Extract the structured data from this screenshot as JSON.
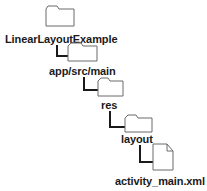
{
  "tree": {
    "nodes": [
      {
        "type": "folder",
        "label": "LinearLayoutExample"
      },
      {
        "type": "folder",
        "label": "app/src/main"
      },
      {
        "type": "folder",
        "label": "res"
      },
      {
        "type": "folder",
        "label": "layout"
      },
      {
        "type": "file",
        "label": "activity_main.xml"
      }
    ]
  },
  "colors": {
    "icon_stroke": "#6a6a6a",
    "text": "#1a1a1a",
    "connector": "#1a1a1a",
    "background": "#ffffff"
  }
}
